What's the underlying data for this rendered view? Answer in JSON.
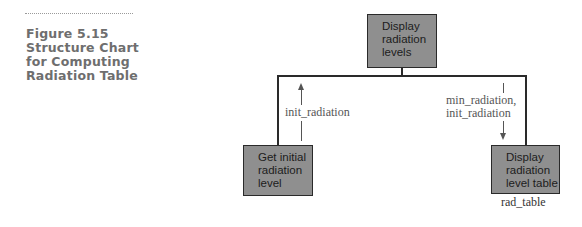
{
  "caption": {
    "lines": [
      "Figure 5.15",
      "Structure Chart",
      "for Computing",
      "Radiation Table"
    ]
  },
  "chart": {
    "root": {
      "lines": [
        "Display",
        "radiation",
        "levels"
      ]
    },
    "children": [
      {
        "lines": [
          "Get initial",
          "radiation",
          "level"
        ],
        "flow_up": [
          "init_radiation"
        ]
      },
      {
        "lines": [
          "Display",
          "radiation",
          "level table"
        ],
        "flow_down": [
          "min_radiation,",
          "init_radiation"
        ],
        "module_name": "rad_table"
      }
    ]
  },
  "colors": {
    "box_fill": "#8f8f8f",
    "box_border": "#2a2a2a",
    "caption": "#6e6e6e"
  }
}
